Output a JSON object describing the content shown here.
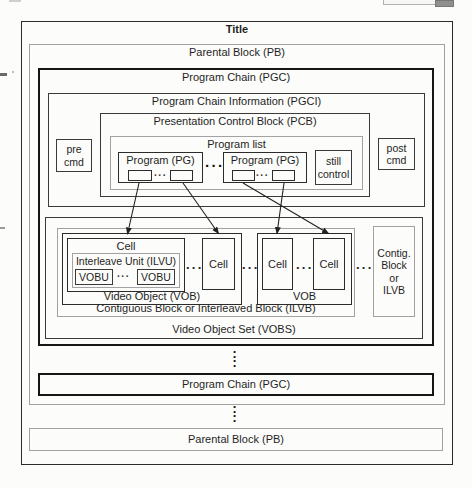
{
  "diagram": {
    "title": "Title",
    "parental_block_top": "Parental Block (PB)",
    "program_chain_top": "Program Chain (PGC)",
    "pgci": "Program Chain Information (PGCI)",
    "pcb": "Presentation Control Block (PCB)",
    "program_list": "Program list",
    "pre_cmd": "pre\ncmd",
    "post_cmd": "post\ncmd",
    "program_pg_left": "Program (PG)",
    "program_pg_right": "Program (PG)",
    "still_control": "still\ncontrol",
    "cell_1": "Cell",
    "cell_2": "Cell",
    "cell_3": "Cell",
    "cell_4": "Cell",
    "ilvu": "Interleave Unit (ILVU)",
    "vobu_1": "VOBU",
    "vobu_2": "VOBU",
    "vob_left": "Video Object (VOB)",
    "vob_right": "VOB",
    "ilvb": "Contiguous Block or Interleaved Block (ILVB)",
    "vobs": "Video Object Set (VOBS)",
    "contig_block": "Contig.\nBlock\nor\nILVB",
    "program_chain_bottom": "Program Chain (PGC)",
    "parental_block_bottom": "Parental Block (PB)",
    "ellipsis_h": "···",
    "ellipsis_v": "····"
  },
  "colors": {
    "line_black": "#2b2b2b",
    "line_gray": "#a2a2a2",
    "paper": "#fcfcfa",
    "arrow": "#222222"
  }
}
